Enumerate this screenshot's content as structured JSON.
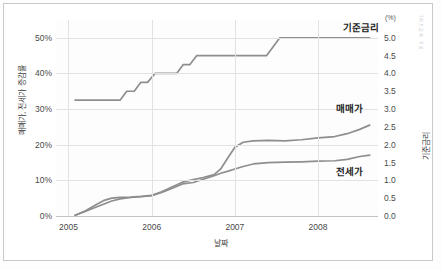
{
  "chart_data": {
    "type": "line",
    "title": "",
    "xlabel": "날짜",
    "ylabel": "매매가, 전세가 증감률",
    "ylabel_right": "기준금리",
    "unit_right": "(%)",
    "x_tick_labels": [
      "2005",
      "2006",
      "2007",
      "2008"
    ],
    "x_tick_values": [
      2005.0,
      2006.0,
      2007.0,
      2008.0
    ],
    "xlim": [
      2004.85,
      2008.72
    ],
    "ylim": [
      0,
      55
    ],
    "ylim_right": [
      0.0,
      5.5
    ],
    "y_tick_labels": [
      "0%",
      "10%",
      "20%",
      "30%",
      "40%",
      "50%"
    ],
    "y_tick_values": [
      0,
      10,
      20,
      30,
      40,
      50
    ],
    "y_right_tick_labels": [
      "0.0",
      "0.5",
      "1.0",
      "1.5",
      "2.0",
      "2.5",
      "3.0",
      "3.5",
      "4.0",
      "4.5",
      "5.0"
    ],
    "y_right_tick_values": [
      0.0,
      0.5,
      1.0,
      1.5,
      2.0,
      2.5,
      3.0,
      3.5,
      4.0,
      4.5,
      5.0
    ],
    "grid": true,
    "legend_position": "inline-right",
    "line_color": "#8e8e8e",
    "series": [
      {
        "name": "기준금리",
        "axis": "right",
        "label_x": 2008.3,
        "label_y": 5.32,
        "points": [
          [
            2005.08,
            3.25
          ],
          [
            2005.62,
            3.25
          ],
          [
            2005.7,
            3.5
          ],
          [
            2005.79,
            3.5
          ],
          [
            2005.87,
            3.75
          ],
          [
            2005.95,
            3.75
          ],
          [
            2006.04,
            4.0
          ],
          [
            2006.3,
            4.0
          ],
          [
            2006.38,
            4.25
          ],
          [
            2006.46,
            4.25
          ],
          [
            2006.54,
            4.5
          ],
          [
            2007.38,
            4.5
          ],
          [
            2007.54,
            5.0
          ],
          [
            2008.62,
            5.0
          ]
        ]
      },
      {
        "name": "매매가",
        "axis": "left",
        "label_x": 2008.22,
        "label_y": 30.5,
        "points": [
          [
            2005.08,
            0.2
          ],
          [
            2005.2,
            1.4
          ],
          [
            2005.32,
            3.0
          ],
          [
            2005.42,
            4.3
          ],
          [
            2005.52,
            5.0
          ],
          [
            2005.62,
            5.2
          ],
          [
            2005.75,
            5.3
          ],
          [
            2005.87,
            5.5
          ],
          [
            2006.0,
            5.8
          ],
          [
            2006.12,
            6.8
          ],
          [
            2006.25,
            8.2
          ],
          [
            2006.37,
            9.5
          ],
          [
            2006.5,
            10.2
          ],
          [
            2006.62,
            10.8
          ],
          [
            2006.75,
            11.6
          ],
          [
            2006.83,
            13.2
          ],
          [
            2006.92,
            16.5
          ],
          [
            2007.0,
            19.3
          ],
          [
            2007.1,
            20.7
          ],
          [
            2007.22,
            21.1
          ],
          [
            2007.4,
            21.2
          ],
          [
            2007.6,
            21.1
          ],
          [
            2007.8,
            21.4
          ],
          [
            2008.0,
            21.9
          ],
          [
            2008.2,
            22.3
          ],
          [
            2008.35,
            23.1
          ],
          [
            2008.5,
            24.3
          ],
          [
            2008.62,
            25.5
          ]
        ]
      },
      {
        "name": "전세가",
        "axis": "left",
        "label_x": 2008.22,
        "label_y": 13.0,
        "points": [
          [
            2005.08,
            0.2
          ],
          [
            2005.2,
            1.3
          ],
          [
            2005.32,
            2.4
          ],
          [
            2005.42,
            3.3
          ],
          [
            2005.52,
            4.2
          ],
          [
            2005.62,
            4.8
          ],
          [
            2005.75,
            5.2
          ],
          [
            2005.87,
            5.4
          ],
          [
            2006.0,
            5.7
          ],
          [
            2006.12,
            6.6
          ],
          [
            2006.25,
            7.8
          ],
          [
            2006.37,
            9.0
          ],
          [
            2006.5,
            9.4
          ],
          [
            2006.62,
            10.3
          ],
          [
            2006.75,
            11.3
          ],
          [
            2006.83,
            12.0
          ],
          [
            2006.92,
            12.6
          ],
          [
            2007.0,
            13.2
          ],
          [
            2007.1,
            13.9
          ],
          [
            2007.22,
            14.6
          ],
          [
            2007.4,
            15.0
          ],
          [
            2007.6,
            15.1
          ],
          [
            2007.8,
            15.2
          ],
          [
            2008.0,
            15.4
          ],
          [
            2008.2,
            15.5
          ],
          [
            2008.35,
            15.9
          ],
          [
            2008.5,
            16.7
          ],
          [
            2008.62,
            17.1
          ]
        ]
      }
    ]
  },
  "watermark": {
    "text": "그래프 출처 · 자료"
  }
}
